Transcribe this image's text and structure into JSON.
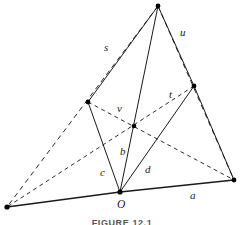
{
  "figure": {
    "caption": "FIGURE 12.1",
    "background_color": "#ffffff",
    "line_color": "#1a1a1a",
    "width": 244,
    "height": 225
  },
  "points": {
    "apex": {
      "name": "apex-vertex",
      "x": 158,
      "y": 6
    },
    "right_mid": {
      "name": "right-middle-vertex",
      "x": 194,
      "y": 86
    },
    "left_mid": {
      "name": "left-middle-vertex",
      "x": 88,
      "y": 102
    },
    "center": {
      "name": "center-intersection",
      "x": 134,
      "y": 126
    },
    "origin": {
      "name": "origin-vertex",
      "x": 120,
      "y": 192
    },
    "bottom_right": {
      "name": "bottom-right-vertex",
      "x": 234,
      "y": 180
    },
    "bottom_left": {
      "name": "bottom-left-vertex",
      "x": 7,
      "y": 207
    }
  },
  "labels": {
    "s": {
      "text": "s",
      "x": 104,
      "y": 42,
      "style": "italic"
    },
    "u": {
      "text": "u",
      "x": 180,
      "y": 27,
      "style": "italic"
    },
    "t": {
      "text": "t",
      "x": 169,
      "y": 89,
      "style": "italic"
    },
    "v": {
      "text": "v",
      "x": 117,
      "y": 103,
      "style": "italic"
    },
    "b": {
      "text": "b",
      "x": 120,
      "y": 146,
      "style": "italic"
    },
    "c": {
      "text": "c",
      "x": 100,
      "y": 167,
      "style": "italic"
    },
    "d": {
      "text": "d",
      "x": 145,
      "y": 164,
      "style": "italic"
    },
    "a": {
      "text": "a",
      "x": 190,
      "y": 190,
      "style": "italic"
    },
    "O": {
      "text": "O",
      "x": 117,
      "y": 199,
      "style": "italic"
    }
  },
  "edges": {
    "solid": [
      {
        "name": "vector-b-origin-to-apex",
        "from": "origin",
        "to": "apex",
        "label": "b"
      },
      {
        "name": "vector-c-origin-to-left-mid",
        "from": "origin",
        "to": "left_mid",
        "label": "c"
      },
      {
        "name": "vector-d-origin-to-right-mid",
        "from": "origin",
        "to": "right_mid",
        "label": "d"
      },
      {
        "name": "segment-left-mid-to-apex",
        "from": "left_mid",
        "to": "apex",
        "label": ""
      },
      {
        "name": "segment-right-mid-to-apex",
        "from": "right_mid",
        "to": "apex",
        "label": ""
      },
      {
        "name": "segment-right-mid-to-bottom-right",
        "from": "right_mid",
        "to": "bottom_right",
        "label": ""
      }
    ],
    "base": [
      {
        "name": "vector-a-origin-to-bottom-right",
        "from": "origin",
        "to": "bottom_right",
        "label": "a"
      },
      {
        "name": "baseline-origin-to-bottom-left",
        "from": "origin",
        "to": "bottom_left",
        "label": ""
      }
    ],
    "dashed": [
      {
        "name": "outer-edge-s-apex-to-bottom-left",
        "from": "apex",
        "to": "bottom_left",
        "label": "s"
      },
      {
        "name": "outer-edge-u-apex-to-bottom-right",
        "from": "apex",
        "to": "bottom_right",
        "label": "u"
      },
      {
        "name": "diagonal-v-left-mid-to-bottom-right",
        "from": "left_mid",
        "to": "bottom_right",
        "label": "v"
      },
      {
        "name": "diagonal-t-right-mid-to-bottom-left",
        "from": "right_mid",
        "to": "bottom_left",
        "label": "t"
      },
      {
        "name": "dashed-apex-to-left-mid-extension",
        "from": "bottom_left",
        "to": "left_mid",
        "label": ""
      }
    ]
  }
}
